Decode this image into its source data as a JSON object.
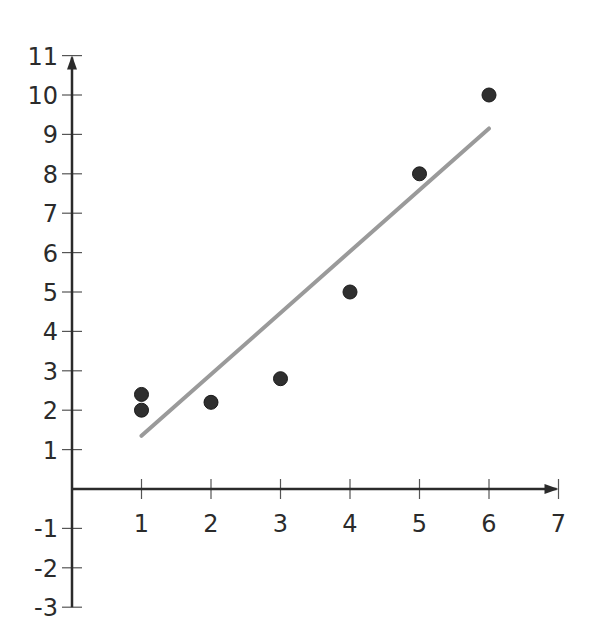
{
  "chart_data": {
    "type": "scatter",
    "title": "",
    "xlabel": "",
    "ylabel": "",
    "xlim": [
      0,
      7
    ],
    "ylim": [
      -3,
      11
    ],
    "grid": false,
    "legend": null,
    "x_ticks": [
      1,
      2,
      3,
      4,
      5,
      6,
      7
    ],
    "y_ticks": [
      -3,
      -2,
      -1,
      1,
      2,
      3,
      4,
      5,
      6,
      7,
      8,
      9,
      10,
      11
    ],
    "series": [
      {
        "name": "data points",
        "type": "scatter",
        "points": [
          {
            "x": 1,
            "y": 2.4
          },
          {
            "x": 1,
            "y": 2.0
          },
          {
            "x": 2,
            "y": 2.2
          },
          {
            "x": 3,
            "y": 2.8
          },
          {
            "x": 4,
            "y": 5.0
          },
          {
            "x": 5,
            "y": 8.0
          },
          {
            "x": 6,
            "y": 10.0
          }
        ],
        "color": "#2f2f2f"
      },
      {
        "name": "line of best fit",
        "type": "line",
        "points": [
          {
            "x": 1,
            "y": 1.35
          },
          {
            "x": 6,
            "y": 9.15
          }
        ],
        "color": "#9a9a9a"
      }
    ]
  },
  "axes": {
    "color": "#2b2b2b"
  }
}
